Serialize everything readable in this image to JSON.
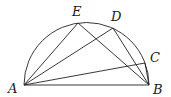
{
  "diagram": {
    "type": "semicircle-geometry",
    "points": {
      "A": {
        "label": "A",
        "x": 24,
        "y": 85
      },
      "B": {
        "label": "B",
        "x": 149,
        "y": 85
      },
      "E": {
        "label": "E",
        "x": 78,
        "y": 23
      },
      "D": {
        "label": "D",
        "x": 113,
        "y": 28
      },
      "C": {
        "label": "C",
        "x": 145,
        "y": 63
      }
    },
    "segments": [
      [
        "A",
        "B"
      ],
      [
        "A",
        "E"
      ],
      [
        "A",
        "D"
      ],
      [
        "A",
        "C"
      ],
      [
        "E",
        "B"
      ],
      [
        "D",
        "B"
      ],
      [
        "C",
        "B"
      ]
    ],
    "arc": {
      "from": "A",
      "to": "B",
      "center": [
        86.5,
        85
      ],
      "radius": 62.5
    },
    "line_color": "#222222"
  }
}
